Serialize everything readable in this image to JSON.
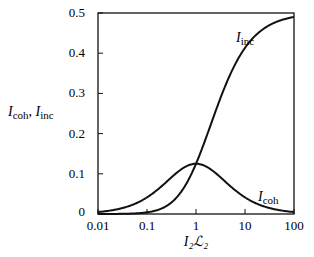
{
  "chart_data": {
    "type": "line",
    "title": "",
    "xlabel": "I₂ℒ₂",
    "ylabel": "I_coh, I_inc",
    "xscale": "log",
    "xlim": [
      0.01,
      100
    ],
    "ylim": [
      0,
      0.5
    ],
    "xticks": [
      "0.01",
      "0.1",
      "1",
      "10",
      "100"
    ],
    "yticks": [
      "0",
      "0.1",
      "0.2",
      "0.3",
      "0.4",
      "0.5"
    ],
    "grid": false,
    "legend": "inline labels",
    "series": [
      {
        "name": "I_inc",
        "x": [
          0.01,
          0.03,
          0.1,
          0.3,
          1,
          3,
          10,
          30,
          100
        ],
        "values": [
          0.0,
          0.0004,
          0.0041,
          0.027,
          0.125,
          0.281,
          0.413,
          0.468,
          0.49
        ]
      },
      {
        "name": "I_coh",
        "x": [
          0.01,
          0.03,
          0.1,
          0.3,
          1,
          3,
          10,
          30,
          100
        ],
        "values": [
          0.0049,
          0.0141,
          0.041,
          0.089,
          0.125,
          0.094,
          0.041,
          0.016,
          0.0049
        ]
      }
    ]
  },
  "labels": {
    "y_axis_main": "I",
    "y_axis_sub1": "coh",
    "y_axis_sep": ", ",
    "y_axis_main2": "I",
    "y_axis_sub2": "inc",
    "x_axis": "I₂ℒ₂",
    "curve_inc_main": "I",
    "curve_inc_sub": "inc",
    "curve_coh_main": "I",
    "curve_coh_sub": "coh"
  }
}
